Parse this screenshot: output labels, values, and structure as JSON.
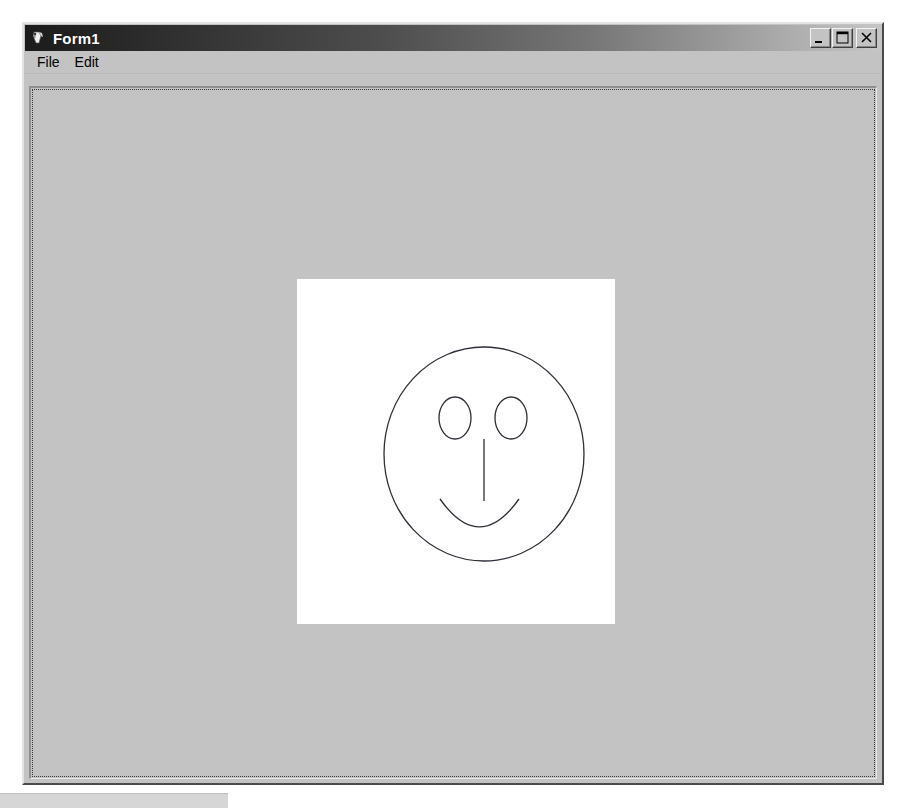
{
  "window": {
    "title": "Form1",
    "icon": "vb-form-icon",
    "buttons": [
      {
        "name": "minimize-button",
        "label": "_",
        "tooltip": "Minimize"
      },
      {
        "name": "maximize-button",
        "label": "□",
        "tooltip": "Maximize"
      },
      {
        "name": "close-button",
        "label": "×",
        "tooltip": "Close"
      }
    ]
  },
  "menu": {
    "items": [
      {
        "label": "File"
      },
      {
        "label": "Edit"
      }
    ]
  },
  "canvas": {
    "name": "picture-box",
    "background": "#ffffff",
    "stroke_color": "#2e2e38",
    "drawing": "smiley-face",
    "shapes": [
      {
        "name": "face-outline",
        "type": "ellipse",
        "cx": 187,
        "cy": 175,
        "rx": 100,
        "ry": 107
      },
      {
        "name": "left-eye",
        "type": "ellipse",
        "cx": 158,
        "cy": 139,
        "rx": 16,
        "ry": 21
      },
      {
        "name": "right-eye",
        "type": "ellipse",
        "cx": 214,
        "cy": 139,
        "rx": 16,
        "ry": 21
      },
      {
        "name": "nose",
        "type": "line",
        "x1": 187,
        "y1": 160,
        "x2": 187,
        "y2": 222
      },
      {
        "name": "mouth",
        "type": "arc",
        "x1": 143,
        "y1": 220,
        "x2": 222,
        "y2": 220,
        "sag": 36
      }
    ]
  },
  "colors": {
    "window_face": "#c3c3c3",
    "title_gradient_start": "#1b1b1b",
    "title_gradient_end": "#c6c6c6",
    "title_text": "#ffffff",
    "canvas_white": "#ffffff",
    "ink": "#2e2e38"
  }
}
